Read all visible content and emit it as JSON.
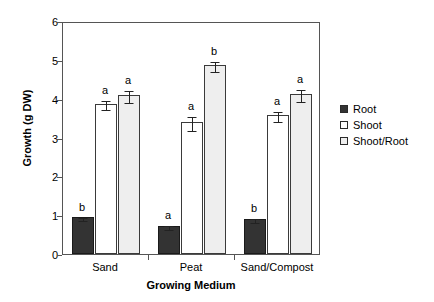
{
  "chart_data": {
    "type": "bar",
    "title": "",
    "xlabel": "Growing Medium",
    "ylabel": "Growth (g DW)",
    "ylim": [
      0,
      6
    ],
    "yticks": [
      "0",
      "1",
      "2",
      "3",
      "4",
      "5",
      "6"
    ],
    "categories": [
      "Sand",
      "Peat",
      "Sand/Compost"
    ],
    "grid": false,
    "legend_position": "right",
    "series": [
      {
        "name": "Root",
        "fill": "#333333",
        "values": [
          0.95,
          0.72,
          0.9
        ],
        "errors": [
          0.04,
          0.05,
          0.06
        ],
        "letters": [
          "b",
          "a",
          "b"
        ]
      },
      {
        "name": "Shoot",
        "fill": "#ffffff",
        "values": [
          3.87,
          3.4,
          3.58
        ],
        "errors": [
          0.12,
          0.17,
          0.14
        ],
        "letters": [
          "a",
          "a",
          "a"
        ]
      },
      {
        "name": "Shoot/Root",
        "fill": "#eeeeee",
        "values": [
          4.1,
          4.87,
          4.12
        ],
        "errors": [
          0.15,
          0.12,
          0.15
        ],
        "letters": [
          "a",
          "b",
          "a"
        ]
      }
    ]
  },
  "legend": {
    "items": [
      {
        "label": "Root"
      },
      {
        "label": "Shoot"
      },
      {
        "label": "Shoot/Root"
      }
    ]
  },
  "axes": {
    "y_title": "Growth (g DW)",
    "x_title": "Growing Medium"
  }
}
